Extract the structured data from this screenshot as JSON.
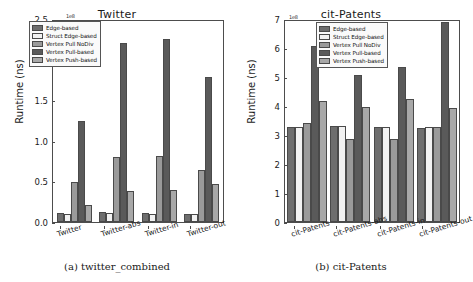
{
  "figure": {
    "panels": [
      {
        "caption": "(a) twitter_combined",
        "title": "Twitter",
        "ylabel": "Runtime (ns)",
        "exponent": "1e8",
        "yticks": [
          "0.0",
          "0.5",
          "1.0",
          "1.5",
          "2.0",
          "2.5"
        ]
      },
      {
        "caption": "(b) cit-Patents",
        "title": "cit-Patents",
        "ylabel": "Runtime (ns)",
        "exponent": "1e8",
        "yticks": [
          "0",
          "1",
          "2",
          "3",
          "4",
          "5",
          "6",
          "7"
        ]
      }
    ]
  },
  "legend": {
    "entries": [
      {
        "label": "Edge-based",
        "color": "#6e6e6e"
      },
      {
        "label": "Struct Edge-based",
        "color": "#f2f2f2"
      },
      {
        "label": "Vertex Pull NoDiv",
        "color": "#9a9a9a"
      },
      {
        "label": "Vertex Pull-based",
        "color": "#5a5a5a"
      },
      {
        "label": "Vertex Push-based",
        "color": "#a8a8a8"
      }
    ]
  },
  "chart_data": [
    {
      "type": "bar",
      "title": "Twitter",
      "subcaption": "(a) twitter_combined",
      "xlabel": "",
      "ylabel": "Runtime (ns)",
      "y_exponent": "1e8",
      "ylim": [
        0.0,
        2.5
      ],
      "yticks": [
        0.0,
        0.5,
        1.0,
        1.5,
        2.0,
        2.5
      ],
      "grid": false,
      "legend_position": "upper left",
      "categories": [
        "Twitter",
        "Twitter-abs",
        "Twitter-in",
        "Twitter-out"
      ],
      "series": [
        {
          "name": "Edge-based",
          "color": "#6e6e6e",
          "values": [
            0.11,
            0.12,
            0.11,
            0.1
          ]
        },
        {
          "name": "Struct Edge-based",
          "color": "#f2f2f2",
          "values": [
            0.1,
            0.11,
            0.1,
            0.1
          ]
        },
        {
          "name": "Vertex Pull NoDiv",
          "color": "#9a9a9a",
          "values": [
            0.5,
            0.81,
            0.82,
            0.65
          ]
        },
        {
          "name": "Vertex Pull-based",
          "color": "#5a5a5a",
          "values": [
            1.26,
            2.23,
            2.28,
            1.8
          ]
        },
        {
          "name": "Vertex Push-based",
          "color": "#a8a8a8",
          "values": [
            0.21,
            0.39,
            0.4,
            0.47
          ]
        }
      ]
    },
    {
      "type": "bar",
      "title": "cit-Patents",
      "subcaption": "(b) cit-Patents",
      "xlabel": "",
      "ylabel": "Runtime (ns)",
      "y_exponent": "1e8",
      "ylim": [
        0,
        7
      ],
      "yticks": [
        0,
        1,
        2,
        3,
        4,
        5,
        6,
        7
      ],
      "grid": false,
      "legend_position": "upper center",
      "categories": [
        "cit-Patents",
        "cit-Patents-abs",
        "cit-Patents-in",
        "cit-Patents-out"
      ],
      "series": [
        {
          "name": "Edge-based",
          "color": "#6e6e6e",
          "values": [
            3.3,
            3.33,
            3.3,
            3.26
          ]
        },
        {
          "name": "Struct Edge-based",
          "color": "#f2f2f2",
          "values": [
            3.3,
            3.33,
            3.3,
            3.3
          ]
        },
        {
          "name": "Vertex Pull NoDiv",
          "color": "#9a9a9a",
          "values": [
            3.45,
            2.9,
            2.88,
            3.31
          ]
        },
        {
          "name": "Vertex Pull-based",
          "color": "#5a5a5a",
          "values": [
            6.13,
            5.12,
            5.4,
            6.98
          ]
        },
        {
          "name": "Vertex Push-based",
          "color": "#a8a8a8",
          "values": [
            4.22,
            4.0,
            4.3,
            3.97
          ]
        }
      ]
    }
  ]
}
